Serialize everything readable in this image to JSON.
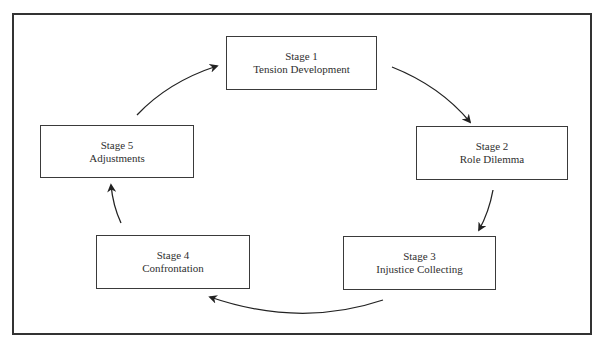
{
  "diagram": {
    "type": "cycle",
    "stages": [
      {
        "number_label": "Stage 1",
        "title": "Tension Development"
      },
      {
        "number_label": "Stage 2",
        "title": "Role Dilemma"
      },
      {
        "number_label": "Stage 3",
        "title": "Injustice Collecting"
      },
      {
        "number_label": "Stage 4",
        "title": "Confrontation"
      },
      {
        "number_label": "Stage 5",
        "title": "Adjustments"
      }
    ],
    "flow": [
      {
        "from": "Stage 1",
        "to": "Stage 2"
      },
      {
        "from": "Stage 2",
        "to": "Stage 3"
      },
      {
        "from": "Stage 3",
        "to": "Stage 4"
      },
      {
        "from": "Stage 4",
        "to": "Stage 5"
      },
      {
        "from": "Stage 5",
        "to": "Stage 1"
      }
    ],
    "colors": {
      "border": "#333333",
      "arrow": "#222222",
      "text": "#2f2f2f",
      "background": "#ffffff"
    }
  }
}
